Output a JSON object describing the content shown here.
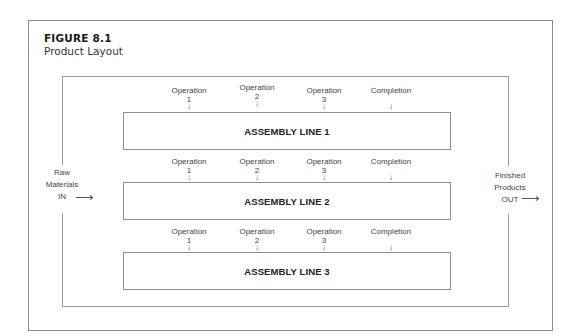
{
  "figure": {
    "number": "FIGURE 8.1",
    "title": "Product Layout"
  },
  "input": {
    "lines": [
      "Raw",
      "Materials",
      "IN"
    ],
    "arrow": "⟶"
  },
  "output": {
    "lines": [
      "Finished",
      "Products",
      "OUT"
    ],
    "arrow": "⟶"
  },
  "stations": [
    {
      "label": "Operation",
      "num": "1"
    },
    {
      "label": "Operation",
      "num": "2"
    },
    {
      "label": "Operation",
      "num": "3"
    },
    {
      "label": "Completion",
      "num": ""
    }
  ],
  "station_arrow": "↓",
  "assembly_lines": [
    {
      "label": "ASSEMBLY LINE 1"
    },
    {
      "label": "ASSEMBLY LINE 2"
    },
    {
      "label": "ASSEMBLY LINE 3"
    }
  ]
}
